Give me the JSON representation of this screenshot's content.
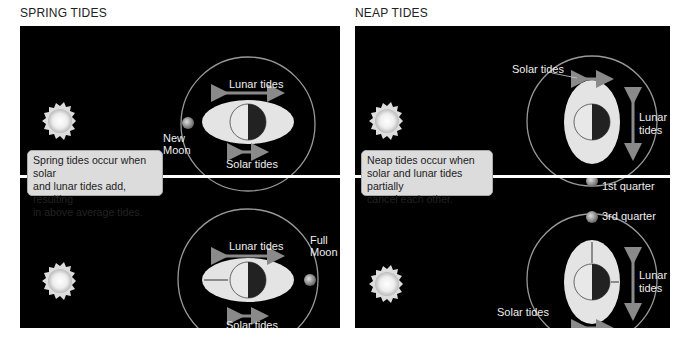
{
  "spring": {
    "title": "SPRING TIDES",
    "note_lines": [
      "Spring tides occur when solar",
      "and lunar tides add, resulting",
      "in above average tides."
    ],
    "top": {
      "lunar_label": "Lunar tides",
      "solar_label": "Solar tides",
      "moon_label_1": "New",
      "moon_label_2": "Moon"
    },
    "bottom": {
      "lunar_label": "Lunar tides",
      "solar_label": "Solar tides",
      "moon_label_1": "Full",
      "moon_label_2": "Moon"
    }
  },
  "neap": {
    "title": "NEAP TIDES",
    "note_lines": [
      "Neap tides occur when",
      "solar and lunar tides partially",
      "cancel each other."
    ],
    "top": {
      "solar_label": "Solar tides",
      "lunar_label_1": "Lunar",
      "lunar_label_2": "tides",
      "moon_label": "1st quarter"
    },
    "bottom": {
      "solar_label": "Solar tides",
      "lunar_label_1": "Lunar",
      "lunar_label_2": "tides",
      "moon_label": "3rd quarter"
    }
  },
  "colors": {
    "background": "#000000",
    "bulge": "#e6e6e6",
    "arrow": "#8a8a8a",
    "note_bg": "#dcdcdc"
  }
}
